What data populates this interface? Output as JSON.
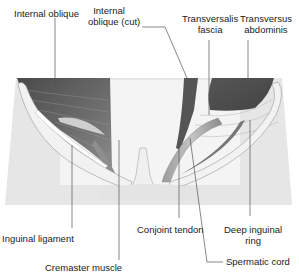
{
  "labels": {
    "internal_oblique": "Internal oblique",
    "internal_oblique_cut_1": "Internal",
    "internal_oblique_cut_2": "oblique (cut)",
    "transversalis_fascia_1": "Transversalis",
    "transversalis_fascia_2": "fascia",
    "transversus_abdominis_1": "Transversus",
    "transversus_abdominis_2": "abdominis",
    "inguinal_ligament": "Inguinal ligament",
    "cremaster_muscle": "Cremaster muscle",
    "conjoint_tendon": "Conjoint tendon",
    "deep_inguinal_ring_1": "Deep inguinal",
    "deep_inguinal_ring_2": "ring",
    "spermatic_cord": "Spermatic cord"
  },
  "colors": {
    "muscle_dark": "#5a5a5a",
    "muscle_mid": "#8a8a8a",
    "ligament_light": "#e8e8e8",
    "background_tissue": "#e2e2e2",
    "leader_line": "#555555"
  }
}
